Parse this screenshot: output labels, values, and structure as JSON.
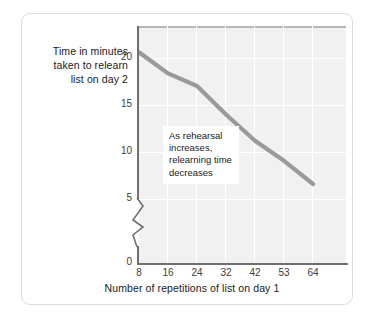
{
  "chart_data": {
    "type": "line",
    "title": "",
    "subtitle": "",
    "xlabel": "Number of repetitions of list on day 1",
    "ylabel": "Time in minutes taken to relearn list on day 2",
    "ylabel_lines": [
      "Time in minutes",
      "taken to relearn",
      "list on day 2"
    ],
    "categories": [
      "8",
      "16",
      "24",
      "32",
      "42",
      "53",
      "64"
    ],
    "x": [
      8,
      16,
      24,
      32,
      42,
      53,
      64
    ],
    "values": [
      20,
      18,
      16.8,
      14.1,
      11.6,
      9.7,
      7.5
    ],
    "series": [
      {
        "name": "Relearning time",
        "color": "#9a9a9a",
        "values": [
          20,
          18,
          16.8,
          14.1,
          11.6,
          9.7,
          7.5
        ]
      }
    ],
    "y_ticks": [
      20,
      15,
      10,
      5,
      0
    ],
    "ytick_labels": [
      "20",
      "15",
      "10",
      "5",
      "0"
    ],
    "xtick_labels": [
      "8",
      "16",
      "24",
      "32",
      "42",
      "53",
      "64"
    ],
    "ylim": [
      0,
      22.5
    ],
    "xlim": [
      8,
      71
    ],
    "grid": true,
    "legend": false,
    "axis_break": true,
    "axis_break_between": [
      0,
      5
    ],
    "plot_background": "#f1f1f1",
    "gridline_color": "#ffffff",
    "axis_color": "#6f6f6f",
    "annotations": [
      {
        "name": "trend-callout",
        "lines": [
          "As rehearsal",
          "increases,",
          "relearning time",
          "decreases"
        ],
        "text": "As rehearsal increases, relearning time decreases",
        "background": "#ffffff"
      }
    ]
  },
  "figure": {
    "card_background": "#ffffff",
    "card_border": "#dcdcdc"
  }
}
